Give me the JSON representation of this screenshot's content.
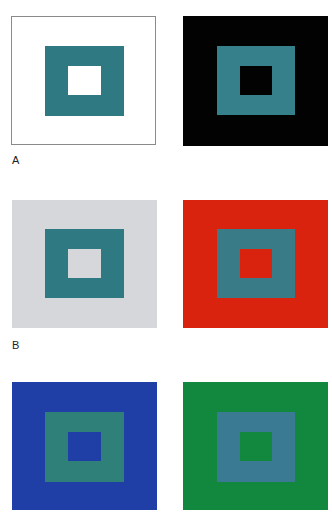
{
  "figure": {
    "rows": [
      {
        "label": "A",
        "panels": [
          {
            "name": "white-background",
            "background": "#ffffff",
            "border": "#8a8a8a",
            "square": "#2f7a82",
            "center": "#ffffff"
          },
          {
            "name": "black-background",
            "background": "#020202",
            "border": null,
            "square": "#35808a",
            "center": "#020202"
          }
        ]
      },
      {
        "label": "B",
        "panels": [
          {
            "name": "gray-background",
            "background": "#d6d7da",
            "border": null,
            "square": "#2f7a82",
            "center": "#d6d7da"
          },
          {
            "name": "red-background",
            "background": "#d9230f",
            "border": null,
            "square": "#397b86",
            "center": "#d9230f"
          }
        ]
      },
      {
        "label": "",
        "panels": [
          {
            "name": "blue-background",
            "background": "#1f3fa6",
            "border": null,
            "square": "#2f8079",
            "center": "#1f3fa6"
          },
          {
            "name": "green-background",
            "background": "#12883e",
            "border": null,
            "square": "#3a7a92",
            "center": "#12883e"
          }
        ]
      }
    ]
  }
}
